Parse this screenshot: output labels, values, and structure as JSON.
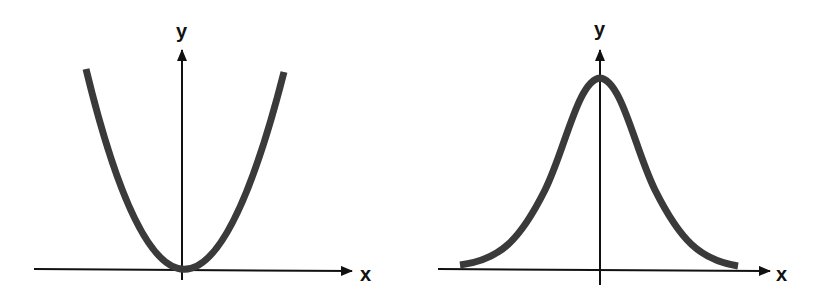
{
  "diagrams": [
    {
      "name": "parabola",
      "description": "U-shaped curve y = x^2 with minimum at origin",
      "x_label": "x",
      "y_label": "y",
      "curve_color": "#3a3a3a",
      "axis_color": "#111111"
    },
    {
      "name": "bell-curve",
      "description": "Gaussian bell-shaped curve centered on y-axis",
      "x_label": "x",
      "y_label": "y",
      "curve_color": "#3a3a3a",
      "axis_color": "#111111"
    }
  ]
}
